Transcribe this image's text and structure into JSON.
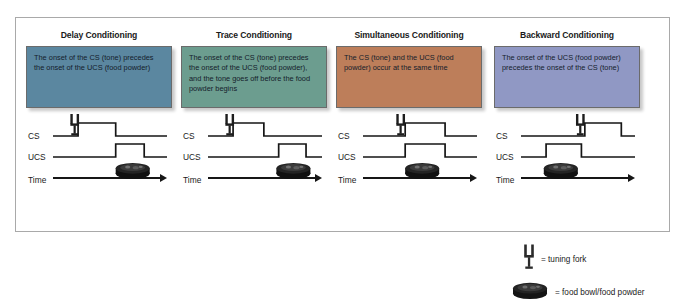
{
  "diagram": {
    "axis_labels": {
      "cs": "CS",
      "ucs": "UCS",
      "time": "Time"
    },
    "panels": [
      {
        "title": "Delay Conditioning",
        "description": "The onset of the CS (tone) precedes the onset of the UCS (food powder)",
        "color": "#5b87a0",
        "cs_pulse": {
          "start": 0.22,
          "end": 0.55
        },
        "ucs_pulse": {
          "start": 0.55,
          "end": 0.8
        },
        "fork_x": 0.19,
        "bowl_x": 0.55
      },
      {
        "title": "Trace Conditioning",
        "description": "The onset of the CS (tone) precedes the onset of the UCS (food powder), and the tone goes off before the food powder begins",
        "color": "#6c9d8f",
        "cs_pulse": {
          "start": 0.22,
          "end": 0.49
        },
        "ucs_pulse": {
          "start": 0.62,
          "end": 0.86
        },
        "fork_x": 0.19,
        "bowl_x": 0.6
      },
      {
        "title": "Simultaneous Conditioning",
        "description": "The CS (tone) and the UCS (food powder) occur at the same time",
        "color": "#bd7e5a",
        "cs_pulse": {
          "start": 0.37,
          "end": 0.72
        },
        "ucs_pulse": {
          "start": 0.37,
          "end": 0.72
        },
        "fork_x": 0.33,
        "bowl_x": 0.37
      },
      {
        "title": "Backward Conditioning",
        "description": "The onset of the UCS (food powder) precedes the onset of the CS (tone)",
        "color": "#9098c4",
        "cs_pulse": {
          "start": 0.56,
          "end": 0.88
        },
        "ucs_pulse": {
          "start": 0.22,
          "end": 0.53
        },
        "fork_x": 0.52,
        "bowl_x": 0.2
      }
    ]
  },
  "legend": {
    "items": [
      {
        "icon": "tuning-fork-icon",
        "label": "= tuning fork"
      },
      {
        "icon": "food-bowl-icon",
        "label": "= food bowl/food powder"
      }
    ]
  }
}
